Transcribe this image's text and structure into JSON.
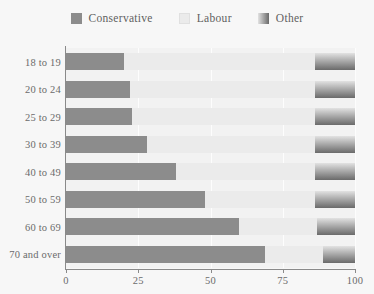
{
  "chart_data": {
    "type": "bar",
    "orientation": "horizontal",
    "stacked": true,
    "stack_mode": "percent",
    "title": "",
    "subtitle": "",
    "xlabel": "",
    "ylabel": "",
    "xlim": [
      0,
      100
    ],
    "xticks": [
      0,
      25,
      50,
      75,
      100
    ],
    "xticklabels": [
      "0",
      "25",
      "50",
      "75",
      "100"
    ],
    "grid": true,
    "grid_axis": "x",
    "legend_position": "top-center",
    "categories": [
      "18 to 19",
      "20 to 24",
      "25 to 29",
      "30 to 39",
      "40 to 49",
      "50 to 59",
      "60 to 69",
      "70 and over"
    ],
    "series": [
      {
        "name": "Conservative",
        "color": "#8c8c8c",
        "values": [
          20,
          22,
          23,
          28,
          38,
          48,
          60,
          69
        ]
      },
      {
        "name": "Labour",
        "color": "#ebebeb",
        "values": [
          66,
          64,
          63,
          58,
          48,
          38,
          27,
          20
        ]
      },
      {
        "name": "Other",
        "color": "#9a9a9a",
        "gradient": [
          "#e2e2e2",
          "#6a6a6a"
        ],
        "values": [
          14,
          14,
          14,
          14,
          14,
          14,
          13,
          11
        ]
      }
    ]
  },
  "legend": {
    "items": [
      {
        "label": "Conservative",
        "swatch": "conservative-swatch"
      },
      {
        "label": "Labour",
        "swatch": "labour-swatch"
      },
      {
        "label": "Other",
        "swatch": "other-swatch"
      }
    ]
  },
  "colors": {
    "background": "#f7f7f7",
    "plot_background": "#f2f2f2",
    "axis": "#8a8a8a",
    "gridline": "#fdfdfd",
    "text": "#6b6b6b",
    "conservative": "#8c8c8c",
    "labour": "#ebebeb",
    "other_light": "#e2e2e2",
    "other_dark": "#6a6a6a"
  }
}
